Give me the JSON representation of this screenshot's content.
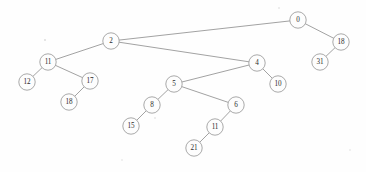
{
  "diagram": {
    "type": "tree",
    "background_color": "#fefefe",
    "node_fill_color": "#fdfdfd",
    "node_stroke_color": "#9a9a9a",
    "edge_color": "#8a8a8a",
    "label_color": "#2b2b2b",
    "node_radius": 8.2,
    "nodes": [
      {
        "id": "n0",
        "label": "0",
        "x": 298,
        "y": 20
      },
      {
        "id": "n18",
        "label": "18",
        "x": 341,
        "y": 42
      },
      {
        "id": "n31",
        "label": "31",
        "x": 320,
        "y": 62
      },
      {
        "id": "n2",
        "label": "2",
        "x": 111,
        "y": 41
      },
      {
        "id": "n11",
        "label": "11",
        "x": 48,
        "y": 62
      },
      {
        "id": "n12",
        "label": "12",
        "x": 27,
        "y": 82
      },
      {
        "id": "n17",
        "label": "17",
        "x": 90,
        "y": 81
      },
      {
        "id": "n18b",
        "label": "18",
        "x": 69,
        "y": 102
      },
      {
        "id": "n4",
        "label": "4",
        "x": 257,
        "y": 63
      },
      {
        "id": "n10",
        "label": "10",
        "x": 278,
        "y": 84
      },
      {
        "id": "n5",
        "label": "5",
        "x": 174,
        "y": 84
      },
      {
        "id": "n8",
        "label": "8",
        "x": 152,
        "y": 105
      },
      {
        "id": "n15",
        "label": "15",
        "x": 131,
        "y": 126
      },
      {
        "id": "n6",
        "label": "6",
        "x": 236,
        "y": 105
      },
      {
        "id": "n11b",
        "label": "11",
        "x": 215,
        "y": 127
      },
      {
        "id": "n21",
        "label": "21",
        "x": 194,
        "y": 148
      }
    ],
    "edges": [
      {
        "from": "n0",
        "to": "n2"
      },
      {
        "from": "n0",
        "to": "n18"
      },
      {
        "from": "n18",
        "to": "n31"
      },
      {
        "from": "n2",
        "to": "n11"
      },
      {
        "from": "n2",
        "to": "n4"
      },
      {
        "from": "n11",
        "to": "n12"
      },
      {
        "from": "n11",
        "to": "n17"
      },
      {
        "from": "n17",
        "to": "n18b"
      },
      {
        "from": "n4",
        "to": "n5"
      },
      {
        "from": "n4",
        "to": "n10"
      },
      {
        "from": "n5",
        "to": "n8"
      },
      {
        "from": "n5",
        "to": "n6"
      },
      {
        "from": "n8",
        "to": "n15"
      },
      {
        "from": "n6",
        "to": "n11b"
      },
      {
        "from": "n11b",
        "to": "n21"
      }
    ],
    "specks": [
      {
        "x": 45,
        "y": 40,
        "r": 0.9
      },
      {
        "x": 279,
        "y": 8,
        "r": 0.8
      },
      {
        "x": 155,
        "y": 118,
        "r": 0.8
      },
      {
        "x": 122,
        "y": 160,
        "r": 0.7
      },
      {
        "x": 350,
        "y": 150,
        "r": 0.7
      }
    ]
  }
}
